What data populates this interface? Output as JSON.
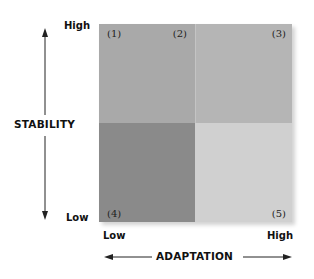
{
  "diagram": {
    "type": "2x2 matrix",
    "y_axis": {
      "title": "STABILITY",
      "high_label": "High",
      "low_label": "Low"
    },
    "x_axis": {
      "title": "ADAPTATION",
      "low_label": "Low",
      "high_label": "High"
    },
    "quadrants": [
      {
        "position": "top-left",
        "color": "#a9a9a9",
        "labels": [
          "(1)",
          "(2)"
        ]
      },
      {
        "position": "top-right",
        "color": "#b5b5b5",
        "labels": [
          "(3)"
        ]
      },
      {
        "position": "bottom-left",
        "color": "#8a8a8a",
        "labels": [
          "(4)"
        ]
      },
      {
        "position": "bottom-right",
        "color": "#d0d0d0",
        "labels": [
          "(5)"
        ]
      }
    ],
    "marker_1": "(1)",
    "marker_2": "(2)",
    "marker_3": "(3)",
    "marker_4": "(4)",
    "marker_5": "(5)"
  }
}
